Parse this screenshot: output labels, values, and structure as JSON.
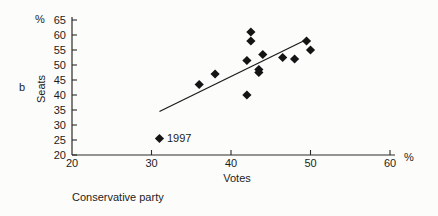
{
  "figure": {
    "panel_label": "b",
    "y_axis_unit": "%",
    "x_axis_unit": "%",
    "caption": "Conservative party"
  },
  "chart_data": {
    "type": "scatter",
    "title": "",
    "xlabel": "Votes",
    "ylabel": "Seats",
    "xlim": [
      20,
      60
    ],
    "ylim": [
      20,
      65
    ],
    "x_ticks": [
      20,
      30,
      40,
      50,
      60
    ],
    "y_ticks": [
      20,
      25,
      30,
      35,
      40,
      45,
      50,
      55,
      60,
      65
    ],
    "grid": false,
    "legend": null,
    "marker": "filled-diamond",
    "marker_color": "#141414",
    "axis_color": "#2a2a2a",
    "points": [
      {
        "x": 31.0,
        "y": 25.5,
        "label": "1997"
      },
      {
        "x": 36.0,
        "y": 43.5
      },
      {
        "x": 38.0,
        "y": 47.0
      },
      {
        "x": 42.0,
        "y": 40.0
      },
      {
        "x": 42.0,
        "y": 51.5
      },
      {
        "x": 42.5,
        "y": 58.0
      },
      {
        "x": 42.5,
        "y": 61.0
      },
      {
        "x": 43.5,
        "y": 47.5
      },
      {
        "x": 43.5,
        "y": 48.5
      },
      {
        "x": 44.0,
        "y": 53.5
      },
      {
        "x": 46.5,
        "y": 52.5
      },
      {
        "x": 48.0,
        "y": 52.0
      },
      {
        "x": 49.5,
        "y": 58.0
      },
      {
        "x": 50.0,
        "y": 55.0
      }
    ],
    "trend_line": {
      "x1": 31.0,
      "y1": 34.5,
      "x2": 49.5,
      "y2": 58.5
    }
  }
}
